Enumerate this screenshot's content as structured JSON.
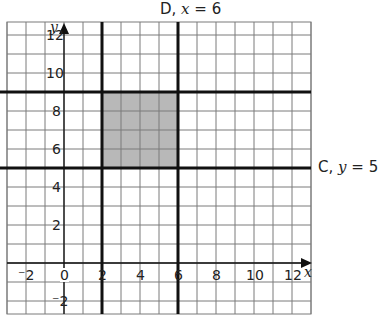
{
  "diagram": {
    "type": "coordinate-grid",
    "title_top": {
      "name": "D",
      "equation_var": "x",
      "equation_val": "6"
    },
    "label_right": {
      "name": "C",
      "equation_var": "y",
      "equation_val": "5"
    },
    "x_axis": {
      "label": "x",
      "ticks": [
        "-2",
        "0",
        "2",
        "4",
        "6",
        "8",
        "10",
        "12"
      ]
    },
    "y_axis": {
      "label": "y",
      "ticks": [
        "12",
        "10",
        "8",
        "6",
        "4",
        "2",
        "-2"
      ]
    },
    "bold_lines": [
      {
        "type": "vertical",
        "x": 2
      },
      {
        "type": "vertical",
        "x": 6
      },
      {
        "type": "horizontal",
        "y": 5
      },
      {
        "type": "horizontal",
        "y": 9
      }
    ],
    "shaded_region": {
      "x_min": 2,
      "x_max": 6,
      "y_min": 5,
      "y_max": 9,
      "color": "#b8b8b8"
    },
    "grid_color": "#7a7a7a",
    "line_color": "#111111"
  }
}
